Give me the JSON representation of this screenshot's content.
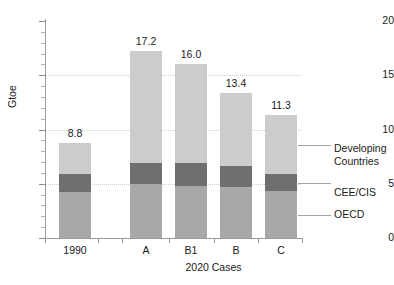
{
  "chart_data": {
    "type": "bar",
    "subtype": "stacked-bar",
    "title": "",
    "xlabel": "2020 Cases",
    "ylabel": "Gtoe",
    "ylim": [
      0,
      20
    ],
    "yticks": [
      0,
      5,
      10,
      15,
      20
    ],
    "ytick_labels": [
      "0",
      "5",
      "10",
      "15",
      "20"
    ],
    "minor_tick_step": 1,
    "grid": "horizontal-dotted at 5, 10, 15",
    "legend_position": "right-callouts",
    "categories": [
      "1990",
      "A",
      "B1",
      "B",
      "C"
    ],
    "totals": [
      8.8,
      17.2,
      16.0,
      13.4,
      11.3
    ],
    "total_labels": [
      "8.8",
      "17.2",
      "16.0",
      "13.4",
      "11.3"
    ],
    "series": [
      {
        "name": "OECD",
        "color": "#a8a8a8",
        "values": [
          4.2,
          5.0,
          4.8,
          4.7,
          4.3
        ]
      },
      {
        "name": "CEE/CIS",
        "color": "#6f6f6f",
        "values": [
          1.7,
          1.9,
          2.1,
          1.9,
          1.6
        ]
      },
      {
        "name": "Developing Countries",
        "color": "#cccccc",
        "values": [
          2.9,
          10.3,
          9.1,
          6.8,
          5.4
        ]
      }
    ],
    "annotations": [
      {
        "text": "Developing Countries",
        "target_series": "Developing Countries"
      },
      {
        "text": "CEE/CIS",
        "target_series": "CEE/CIS"
      },
      {
        "text": "OECD",
        "target_series": "OECD"
      }
    ]
  },
  "legend": {
    "items": [
      {
        "line1": "Developing",
        "line2": "Countries"
      },
      {
        "line1": "CEE/CIS",
        "line2": ""
      },
      {
        "line1": "OECD",
        "line2": ""
      }
    ]
  }
}
